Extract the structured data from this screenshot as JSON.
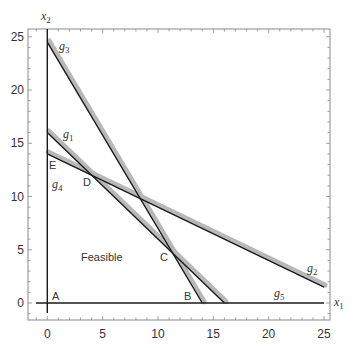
{
  "chart_data": {
    "type": "line",
    "title": "",
    "xlabel": "x1",
    "ylabel": "x2",
    "xlim": [
      -1.7,
      25.6
    ],
    "ylim": [
      -1.6,
      25.7
    ],
    "x_ticks": [
      0,
      5,
      10,
      15,
      20,
      25
    ],
    "y_ticks": [
      0,
      5,
      10,
      15,
      20,
      25
    ],
    "minor_tick_step": 1,
    "grid": false,
    "legend": null,
    "series": [
      {
        "name": "g1",
        "equation": "x1 + x2 = 16",
        "points": [
          [
            0,
            16
          ],
          [
            16,
            0
          ]
        ],
        "label_at": [
          1.6,
          15.0
        ]
      },
      {
        "name": "g2",
        "equation": "x1 + 2 x2 = 28",
        "points": [
          [
            0,
            14
          ],
          [
            25,
            1.5
          ]
        ],
        "label_at": [
          23.6,
          2.8
        ]
      },
      {
        "name": "g3",
        "equation": "7 x1 + 4 x2 = 98",
        "points": [
          [
            0,
            24.5
          ],
          [
            14,
            0
          ]
        ],
        "label_at": [
          1.2,
          23.7
        ]
      },
      {
        "name": "g4",
        "equation": "x1 = 0",
        "points": [
          [
            0,
            -1.0
          ],
          [
            0,
            25.7
          ]
        ],
        "label_at": [
          0.5,
          10.5
        ]
      },
      {
        "name": "g5",
        "equation": "x2 = 0",
        "points": [
          [
            -1.0,
            0
          ],
          [
            25,
            0
          ]
        ],
        "label_at": [
          20.6,
          0.6
        ]
      }
    ],
    "annotations": [
      {
        "text": "A",
        "x": 0.5,
        "y": 0.6
      },
      {
        "text": "B",
        "x": 12.4,
        "y": 0.6
      },
      {
        "text": "C",
        "x": 10.3,
        "y": 4.9
      },
      {
        "text": "D",
        "x": 3.2,
        "y": 10.7
      },
      {
        "text": "E",
        "x": 0.3,
        "y": 12.3
      },
      {
        "text": "Feasible",
        "x": 3.0,
        "y": 4.9
      }
    ],
    "colors": {
      "line": "#1a1a1a",
      "band": "#b8b8b8",
      "frame": "#888888",
      "text": "#333333"
    }
  },
  "labels": {
    "x_axis": "x",
    "x_axis_sub": "1",
    "y_axis": "x",
    "y_axis_sub": "2",
    "feasible": "Feasible",
    "points": {
      "A": "A",
      "B": "B",
      "C": "C",
      "D": "D",
      "E": "E"
    },
    "g1": "g",
    "g1_sub": "1",
    "g2": "g",
    "g2_sub": "2",
    "g3": "g",
    "g3_sub": "3",
    "g4": "g",
    "g4_sub": "4",
    "g5": "g",
    "g5_sub": "5",
    "ticks": {
      "x": [
        "0",
        "5",
        "10",
        "15",
        "20",
        "25"
      ],
      "y": [
        "0",
        "5",
        "10",
        "15",
        "20",
        "25"
      ]
    }
  }
}
